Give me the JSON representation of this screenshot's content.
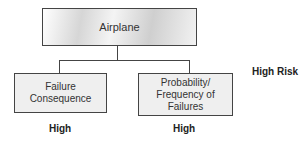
{
  "diagram": {
    "root": {
      "label": "Airplane"
    },
    "children": [
      {
        "label_lines": [
          "Failure",
          "Consequence"
        ],
        "rating": "High"
      },
      {
        "label_lines": [
          "Probability/",
          "Frequency of",
          "Failures"
        ],
        "rating": "High"
      }
    ],
    "result": "High Risk"
  }
}
